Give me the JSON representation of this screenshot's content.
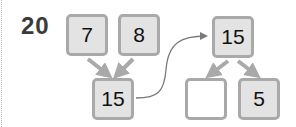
{
  "problem": {
    "number": "20"
  },
  "left_tree": {
    "top_left": "7",
    "top_right": "8",
    "result": "15"
  },
  "right_tree": {
    "top": "15",
    "bottom_left": "",
    "bottom_right": "5"
  },
  "colors": {
    "box_fill": "#e3e3e3",
    "box_border": "#a9a9a9",
    "empty_fill": "#ffffff",
    "arrow": "#a9a9a9",
    "curve": "#7a7a7a"
  }
}
